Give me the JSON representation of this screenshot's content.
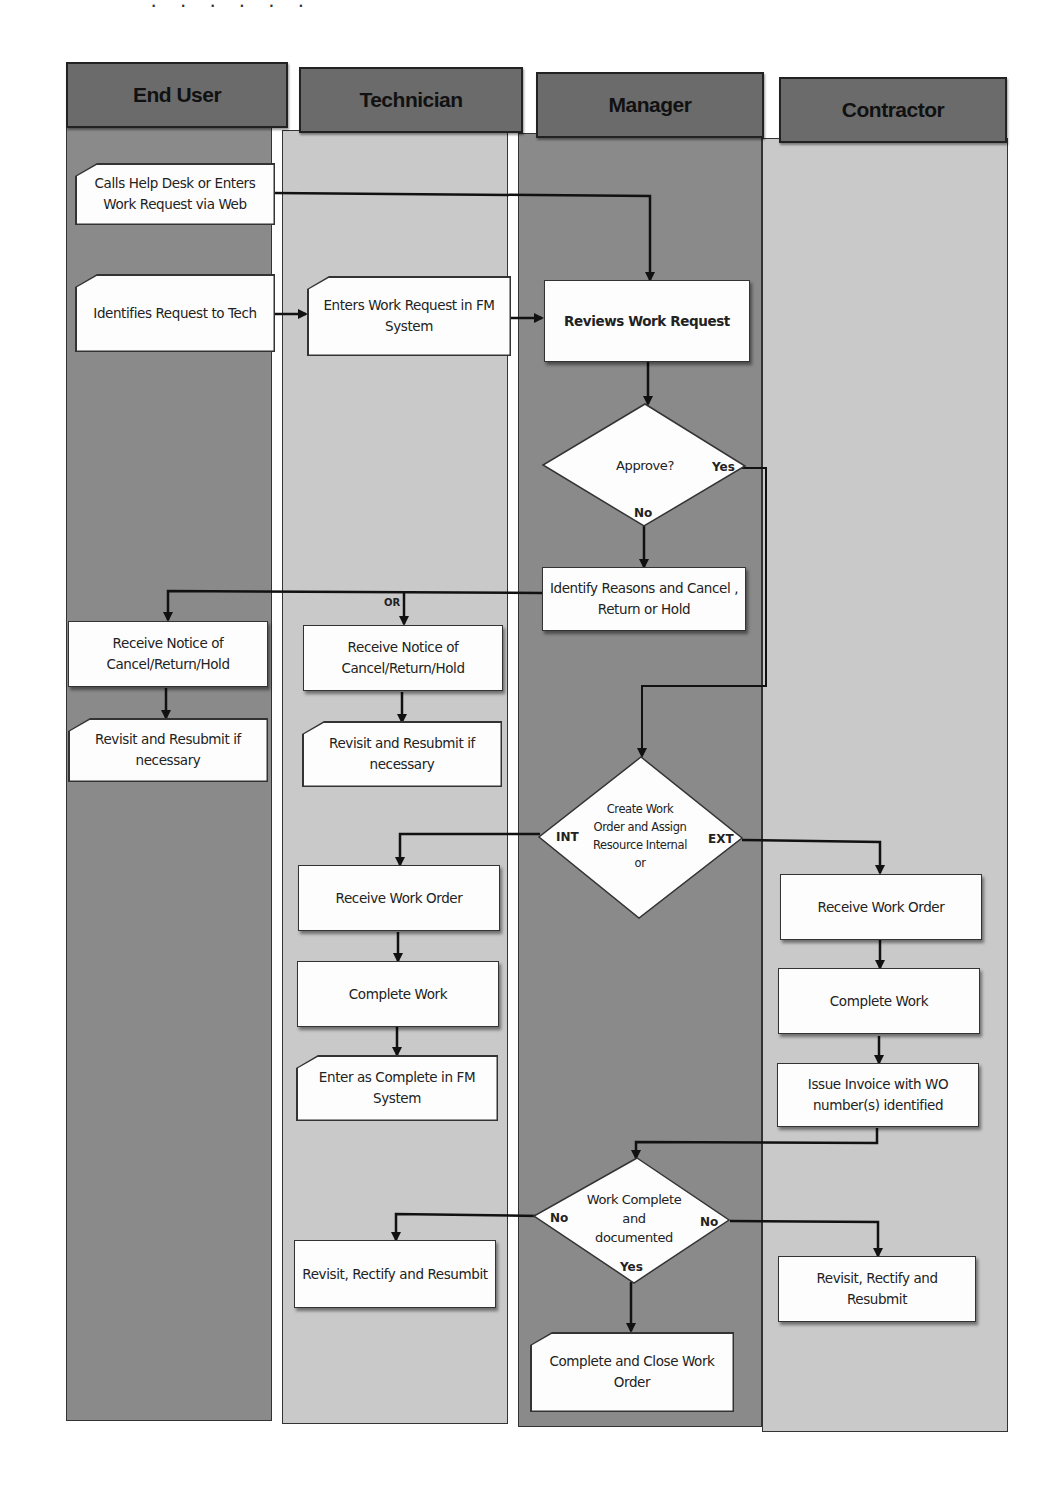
{
  "lanes": [
    {
      "title": "End User"
    },
    {
      "title": "Technician"
    },
    {
      "title": "Manager"
    },
    {
      "title": "Contractor"
    }
  ],
  "nodes": {
    "calls_help_desk": "Calls Help Desk or Enters Work Request via Web",
    "identifies_request": "Identifies Request to Tech",
    "enters_work_request": "Enters Work Request in FM System",
    "reviews_work_request": "Reviews Work Request",
    "approve_decision": "Approve?",
    "identify_reasons": "Identify Reasons and Cancel , Return or Hold",
    "enduser_receive_notice": "Receive Notice of Cancel/Return/Hold",
    "tech_receive_notice": "Receive Notice of Cancel/Return/Hold",
    "enduser_revisit": "Revisit and Resubmit if necessary",
    "tech_revisit": "Revisit and Resubmit if necessary",
    "create_work_order": "Create Work Order and Assign Resource Internal or",
    "tech_receive_work_order": "Receive Work Order",
    "tech_complete_work": "Complete Work",
    "tech_enter_complete": "Enter as Complete in FM System",
    "contractor_receive_work_order": "Receive Work Order",
    "contractor_complete_work": "Complete Work",
    "issue_invoice": "Issue Invoice with WO number(s) identified",
    "work_complete_decision": "Work Complete and documented",
    "tech_revisit_rectify": "Revisit, Rectify and Resumbit",
    "contractor_revisit_rectify": "Revisit,  Rectify and Resubmit",
    "complete_close": "Complete and Close Work Order"
  },
  "labels": {
    "yes": "Yes",
    "no": "No",
    "or": "OR",
    "int": "INT",
    "ext": "EXT"
  },
  "colors": {
    "dark_lane": "#8a8a8a",
    "light_lane": "#c9c9c9",
    "header": "#6b6b6b",
    "node_fill": "#fdfdfd",
    "line": "#111111"
  }
}
